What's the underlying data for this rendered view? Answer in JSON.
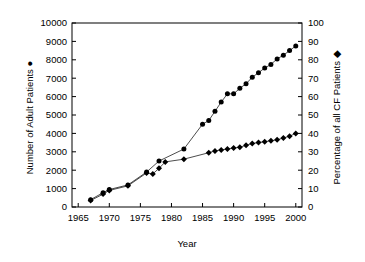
{
  "chart_data": {
    "type": "line",
    "title": "",
    "subtitle": "",
    "xlabel": "Year",
    "ylabel": "Number of Adult Patients",
    "y2label": "Percentage of all CF Patients",
    "xlim": [
      1964,
      2001
    ],
    "ylim": [
      0,
      10000
    ],
    "y2lim": [
      0,
      100
    ],
    "grid": false,
    "legend_position": "inline-axis-title",
    "x_ticks": [
      1965,
      1970,
      1975,
      1980,
      1985,
      1990,
      1995,
      2000
    ],
    "y_ticks": [
      0,
      1000,
      2000,
      3000,
      4000,
      5000,
      6000,
      7000,
      8000,
      9000,
      10000
    ],
    "y2_ticks": [
      0,
      10,
      20,
      30,
      40,
      50,
      60,
      70,
      80,
      90,
      100
    ],
    "series": [
      {
        "name": "Number of Adult Patients",
        "marker": "circle",
        "axis": "left",
        "x": [
          1967,
          1969,
          1970,
          1973,
          1976,
          1978,
          1982,
          1985,
          1986,
          1987,
          1988,
          1989,
          1990,
          1991,
          1992,
          1993,
          1994,
          1995,
          1996,
          1997,
          1998,
          1999,
          2000
        ],
        "values": [
          400,
          780,
          950,
          1200,
          1900,
          2500,
          3150,
          4500,
          4700,
          5200,
          5700,
          6150,
          6150,
          6450,
          6700,
          7050,
          7300,
          7550,
          7750,
          8050,
          8250,
          8500,
          8750
        ]
      },
      {
        "name": "Percentage of all CF Patients",
        "marker": "diamond",
        "axis": "right",
        "x": [
          1967,
          1969,
          1970,
          1973,
          1976,
          1977,
          1978,
          1979,
          1982,
          1986,
          1987,
          1988,
          1989,
          1990,
          1991,
          1992,
          1993,
          1994,
          1995,
          1996,
          1997,
          1998,
          1999,
          2000
        ],
        "values": [
          3.5,
          7.0,
          9.0,
          11.5,
          18.5,
          18.0,
          21.0,
          24.5,
          26.0,
          29.5,
          30.5,
          31.0,
          31.5,
          32.0,
          32.5,
          33.5,
          34.5,
          35.0,
          35.5,
          36.0,
          36.5,
          37.5,
          38.5,
          40.0
        ]
      }
    ]
  },
  "axes": {
    "x_title": "Year",
    "y_left_title": "Number of Adult Patients",
    "y_right_title": "Percentage of all CF Patients",
    "left_marker_glyph": "●",
    "right_marker_glyph": "◆"
  },
  "colors": {
    "ink": "#000000",
    "background": "#ffffff"
  }
}
